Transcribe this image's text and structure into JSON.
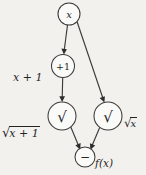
{
  "diagram": {
    "type": "directed-acyclic-graph",
    "background_color": "#f2f1ee",
    "stroke_color": "#3d3b39",
    "text_color": "#26241f",
    "nodes": [
      {
        "id": "x",
        "label": "x",
        "kind": "input",
        "cx": 69,
        "cy": 14,
        "r": 11
      },
      {
        "id": "plus1",
        "label": "+1",
        "kind": "operation",
        "cx": 63,
        "cy": 66,
        "r": 11.5
      },
      {
        "id": "sqrtleft",
        "label": "√",
        "kind": "operation",
        "cx": 62,
        "cy": 116,
        "r": 14
      },
      {
        "id": "sqrtright",
        "label": "√",
        "kind": "operation",
        "cx": 108,
        "cy": 116,
        "r": 14
      },
      {
        "id": "minus",
        "label": "−",
        "kind": "operation",
        "cx": 85,
        "cy": 157,
        "r": 10
      }
    ],
    "edges": [
      {
        "from": "x",
        "to": "plus1"
      },
      {
        "from": "x",
        "to": "sqrtright"
      },
      {
        "from": "plus1",
        "to": "sqrtleft"
      },
      {
        "from": "sqrtleft",
        "to": "minus"
      },
      {
        "from": "sqrtright",
        "to": "minus"
      }
    ],
    "labels": {
      "x_plus_1": "x + 1",
      "sqrt_x_plus_1_radical": "√",
      "sqrt_x_plus_1_radicand": "x + 1",
      "sqrt_x_radical": "√",
      "sqrt_x_radicand": "x",
      "f_of_x": "f(x)"
    }
  }
}
